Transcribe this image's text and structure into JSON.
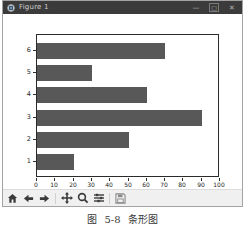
{
  "window": {
    "title": "Figure 1",
    "controls": {
      "minimize": "—",
      "maximize": "▢",
      "close": "✕"
    }
  },
  "chart_data": {
    "type": "bar",
    "orientation": "horizontal",
    "title": "",
    "xlabel": "",
    "ylabel": "",
    "categories": [
      "1",
      "2",
      "3",
      "4",
      "5",
      "6"
    ],
    "values": [
      20,
      50,
      90,
      60,
      30,
      70
    ],
    "xlim": [
      0,
      100
    ],
    "xticks": [
      0,
      10,
      20,
      30,
      40,
      50,
      60,
      70,
      80,
      90,
      100
    ],
    "bar_color": "#585858",
    "grid": false,
    "legend": null
  },
  "toolbar": {
    "buttons": [
      "home",
      "back",
      "forward",
      "pan",
      "zoom",
      "configure-subplots",
      "save"
    ]
  },
  "caption": "图 5-8 条形图",
  "colors": {
    "titlebar": "#3b3b3b",
    "titlebar_text": "#cfcfcf",
    "toolbar_bg": "#f0f0f0",
    "window_border": "#a3a3a3",
    "axes_border": "#2b2b2b",
    "bar": "#585858"
  }
}
